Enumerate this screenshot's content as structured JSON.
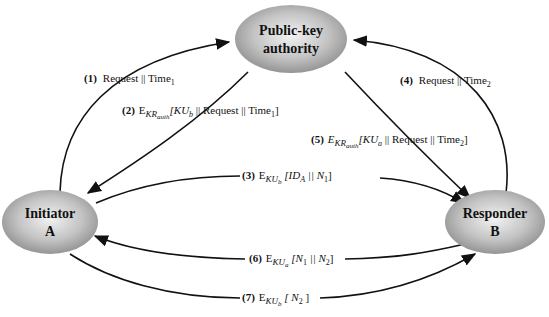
{
  "diagram": {
    "nodes": {
      "authority": {
        "line1": "Public-key",
        "line2": "authority"
      },
      "initiator": {
        "line1": "Initiator",
        "line2": "A"
      },
      "responder": {
        "line1": "Responder",
        "line2": "B"
      }
    },
    "messages": [
      {
        "num": "(1)",
        "text": "Request || Time",
        "sub": "1"
      },
      {
        "num": "(2)",
        "E": "E",
        "key": "KR",
        "keysub": "auth",
        "body": "[KU",
        "bsub": "b",
        "rest": " || Request || Time",
        "rsub": "1",
        "end": "]"
      },
      {
        "num": "(3)",
        "E": "E",
        "key": "KU",
        "keysub": "b",
        "body": " [ID",
        "bsub": "A",
        "rest": " || N",
        "rsub": "1",
        "end": "]"
      },
      {
        "num": "(4)",
        "text": "Request || Time",
        "sub": "2"
      },
      {
        "num": "(5)",
        "E": "E",
        "key": "KR",
        "keysub": "auth",
        "body": "[KU",
        "bsub": "a",
        "rest": " || Request || Time",
        "rsub": "2",
        "end": "]"
      },
      {
        "num": "(6)",
        "E": "E",
        "key": "KU",
        "keysub": "a",
        "body": " [N",
        "bsub": "1",
        "rest": " || N",
        "rsub": "2",
        "end": "]"
      },
      {
        "num": "(7)",
        "E": "E",
        "key": "KU",
        "keysub": "b",
        "body": " [ N",
        "bsub": "2",
        "rest": "",
        "rsub": "",
        "end": " ]"
      }
    ]
  }
}
